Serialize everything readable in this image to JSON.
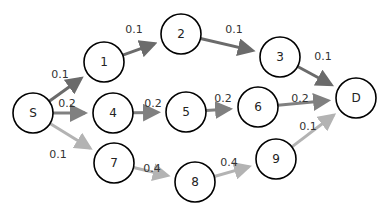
{
  "diagram": {
    "type": "directed-graph",
    "colors": {
      "top_path": "#6b6b6b",
      "middle_path": "#808080",
      "bottom_path": "#b3b3b3"
    },
    "nodes": [
      {
        "id": "S",
        "label": "S",
        "x": 33,
        "y": 113
      },
      {
        "id": "1",
        "label": "1",
        "x": 104,
        "y": 62
      },
      {
        "id": "2",
        "label": "2",
        "x": 181,
        "y": 34
      },
      {
        "id": "3",
        "label": "3",
        "x": 280,
        "y": 57
      },
      {
        "id": "D",
        "label": "D",
        "x": 356,
        "y": 98
      },
      {
        "id": "4",
        "label": "4",
        "x": 113,
        "y": 113
      },
      {
        "id": "5",
        "label": "5",
        "x": 186,
        "y": 112
      },
      {
        "id": "6",
        "label": "6",
        "x": 258,
        "y": 107
      },
      {
        "id": "7",
        "label": "7",
        "x": 114,
        "y": 163
      },
      {
        "id": "8",
        "label": "8",
        "x": 195,
        "y": 182
      },
      {
        "id": "9",
        "label": "9",
        "x": 276,
        "y": 159
      }
    ],
    "edges": [
      {
        "from": "S",
        "to": "1",
        "weight": "0.1",
        "path": "top"
      },
      {
        "from": "1",
        "to": "2",
        "weight": "0.1",
        "path": "top"
      },
      {
        "from": "2",
        "to": "3",
        "weight": "0.1",
        "path": "top"
      },
      {
        "from": "3",
        "to": "D",
        "weight": "0.1",
        "path": "top"
      },
      {
        "from": "S",
        "to": "4",
        "weight": "0.2",
        "path": "middle"
      },
      {
        "from": "4",
        "to": "5",
        "weight": "0.2",
        "path": "middle"
      },
      {
        "from": "5",
        "to": "6",
        "weight": "0.2",
        "path": "middle"
      },
      {
        "from": "6",
        "to": "D",
        "weight": "0.2",
        "path": "middle"
      },
      {
        "from": "S",
        "to": "7",
        "weight": "0.1",
        "path": "bottom"
      },
      {
        "from": "7",
        "to": "8",
        "weight": "0.4",
        "path": "bottom"
      },
      {
        "from": "8",
        "to": "9",
        "weight": "0.4",
        "path": "bottom"
      },
      {
        "from": "9",
        "to": "D",
        "weight": "0.1",
        "path": "bottom"
      }
    ],
    "edge_labels": [
      {
        "text": "0.1",
        "x": 60,
        "y": 74
      },
      {
        "text": "0.1",
        "x": 134,
        "y": 29
      },
      {
        "text": "0.1",
        "x": 234,
        "y": 29
      },
      {
        "text": "0.1",
        "x": 323,
        "y": 56
      },
      {
        "text": "0.2",
        "x": 67,
        "y": 103
      },
      {
        "text": "0.2",
        "x": 153,
        "y": 103
      },
      {
        "text": "0.2",
        "x": 223,
        "y": 98
      },
      {
        "text": "0.2",
        "x": 300,
        "y": 98
      },
      {
        "text": "0.1",
        "x": 58,
        "y": 154
      },
      {
        "text": "0.4",
        "x": 152,
        "y": 168
      },
      {
        "text": "0.4",
        "x": 229,
        "y": 162
      },
      {
        "text": "0.1",
        "x": 308,
        "y": 126
      }
    ]
  }
}
